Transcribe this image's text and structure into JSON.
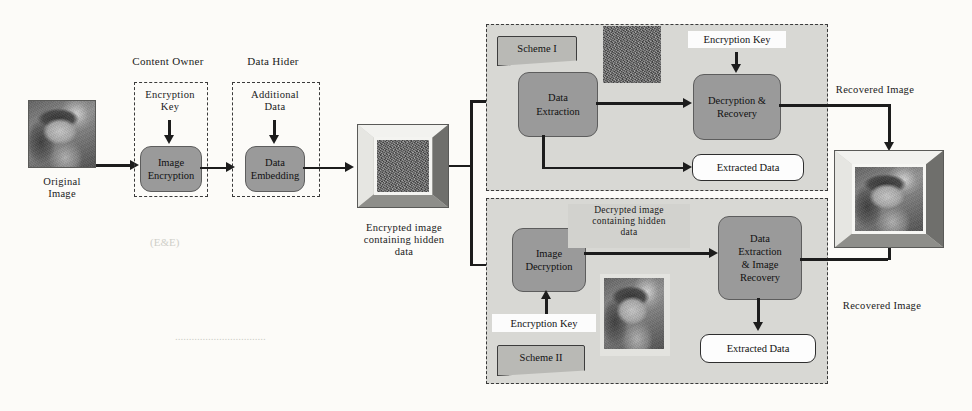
{
  "diagram": {
    "stage_labels": {
      "content_owner": "Content Owner",
      "data_hider": "Data Hider"
    },
    "inputs": {
      "original_image_caption": "Original\nImage",
      "encryption_key_1": "Encryption\nKey",
      "additional_data": "Additional\nData"
    },
    "processes": {
      "image_encryption": "Image\nEncryption",
      "data_embedding": "Data\nEmbedding",
      "data_extraction": "Data\nExtraction",
      "decryption_recovery": "Decryption &\nRecovery",
      "image_decryption": "Image\nDecryption",
      "data_extraction_image_recovery": "Data\nExtraction\n& Image\nRecovery"
    },
    "captions": {
      "encrypted_image": "Encrypted image\ncontaining hidden\ndata",
      "decrypted_image": "Decrypted image\ncontaining hidden\ndata"
    },
    "scheme_one": {
      "banner": "Scheme I",
      "encryption_key": "Encryption Key",
      "extracted_data": "Extracted Data",
      "recovered_image_arrow": "Recovered Image"
    },
    "scheme_two": {
      "banner": "Scheme II",
      "encryption_key": "Encryption Key",
      "extracted_data": "Extracted Data",
      "recovered_image_arrow": "Recovered Image"
    },
    "colors": {
      "process_fill": "#9a9a9a",
      "scheme_panel_fill": "#d8d8d4",
      "banner_fill": "#b9b9b5",
      "line": "#1c1c1c",
      "noise_block": "#6a6a6a",
      "page_background": "#fcfbf8"
    }
  }
}
